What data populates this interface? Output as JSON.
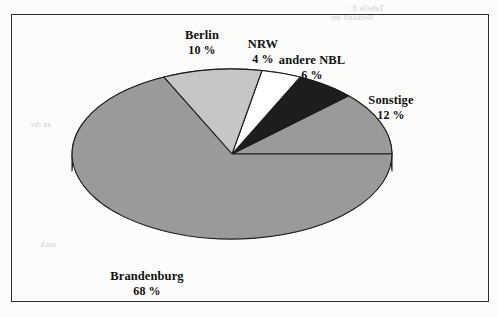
{
  "page": {
    "kind": "scanned-document-figure",
    "bleed_through": [
      "Tabelle 8:",
      "Herkunft der",
      "an der",
      "nach"
    ]
  },
  "chart_data": {
    "type": "pie",
    "title": "",
    "subtitle": "",
    "xlabel": "",
    "ylabel": "",
    "legend_position": "none",
    "style": "3d-exploded-none",
    "percent_suffix": " %",
    "categories": [
      "Sonstige",
      "andere NBL",
      "NRW",
      "Berlin",
      "Brandenburg"
    ],
    "values": [
      12,
      6,
      4,
      10,
      68
    ],
    "slices": [
      {
        "name": "sonstige",
        "label": "Sonstige",
        "value": 12,
        "value_text": "12 %",
        "fill": "#9a9a9a",
        "start_deg": 0,
        "end_deg": 43.2,
        "label_x": 390,
        "label_y": 92
      },
      {
        "name": "andere-nbl",
        "label": "andere NBL",
        "value": 6,
        "value_text": "6 %",
        "fill": "#1d1d1d",
        "start_deg": 43.2,
        "end_deg": 64.8,
        "label_x": 311,
        "label_y": 52
      },
      {
        "name": "nrw",
        "label": "NRW",
        "value": 4,
        "value_text": "4 %",
        "fill": "#ffffff",
        "start_deg": 64.8,
        "end_deg": 79.2,
        "label_x": 262,
        "label_y": 36
      },
      {
        "name": "berlin",
        "label": "Berlin",
        "value": 10,
        "value_text": "10 %",
        "fill": "#c6c6c6",
        "start_deg": 79.2,
        "end_deg": 115.2,
        "label_x": 201,
        "label_y": 27
      },
      {
        "name": "brandenburg",
        "label": "Brandenburg",
        "value": 68,
        "value_text": "68 %",
        "fill": "#9a9a9a",
        "start_deg": 115.2,
        "end_deg": 360,
        "label_x": 146,
        "label_y": 268
      }
    ],
    "geometry": {
      "center_x": 231,
      "center_y": 153,
      "radius_x": 160,
      "radius_y": 85,
      "depth": 17
    },
    "colors": {
      "outline": "#1c1c1c",
      "side_wall": "#8d8d8d",
      "label_text": "#111111",
      "frame": "#2e2e2e",
      "paper": "#fcfcfb"
    }
  }
}
